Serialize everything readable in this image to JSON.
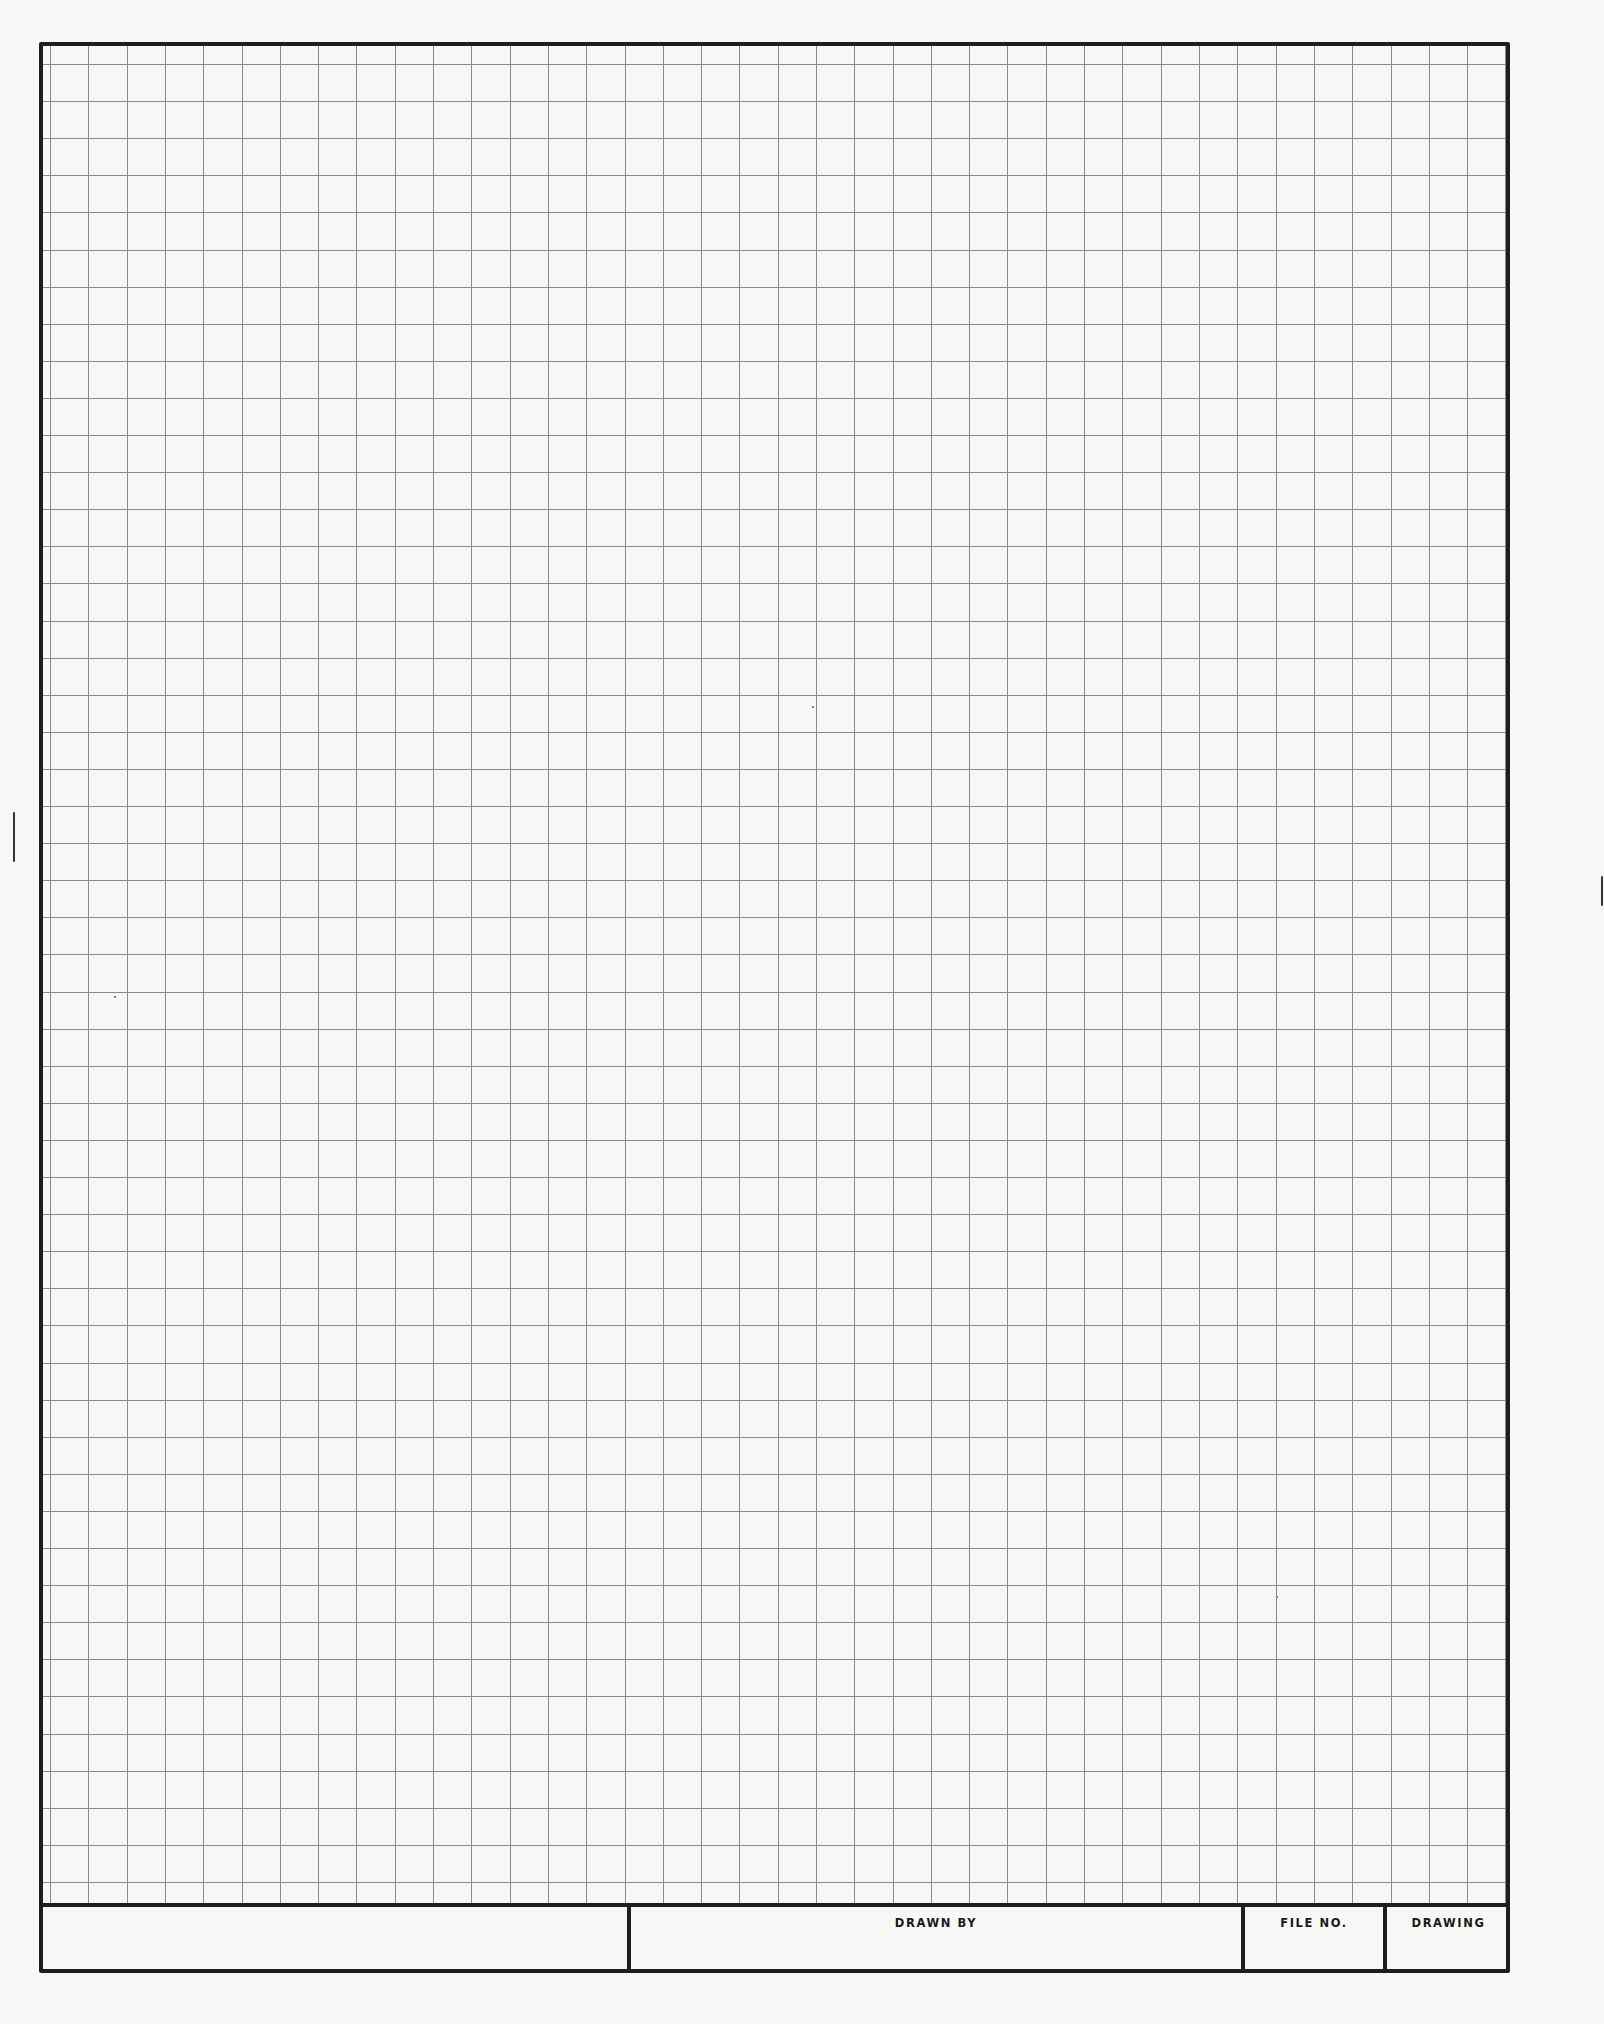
{
  "sheet": {
    "type": "engineering graph paper",
    "background_color": "#f7f7f5",
    "border_color": "#1e1e1e",
    "grid_color": "#8a8a8a",
    "grid": {
      "columns": 38,
      "rows": 49,
      "cell_width_px": 38.3,
      "cell_height_px": 37.1
    }
  },
  "title_block": {
    "cells": [
      {
        "id": "blank",
        "label": ""
      },
      {
        "id": "drawn_by",
        "label": "DRAWN BY"
      },
      {
        "id": "file_no",
        "label": "FILE NO."
      },
      {
        "id": "drawing",
        "label": "DRAWING"
      }
    ]
  }
}
